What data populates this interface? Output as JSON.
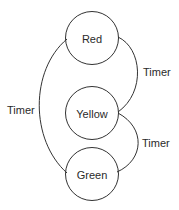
{
  "diagram": {
    "type": "state-machine",
    "states": [
      {
        "id": "red",
        "label": "Red"
      },
      {
        "id": "yellow",
        "label": "Yellow"
      },
      {
        "id": "green",
        "label": "Green"
      }
    ],
    "transitions": [
      {
        "from": "red",
        "to": "yellow",
        "label": "Timer"
      },
      {
        "from": "yellow",
        "to": "green",
        "label": "Timer"
      },
      {
        "from": "green",
        "to": "red",
        "label": "Timer"
      }
    ],
    "colors": {
      "stroke": "#333333",
      "text": "#2a2a2a",
      "background": "#ffffff"
    }
  }
}
